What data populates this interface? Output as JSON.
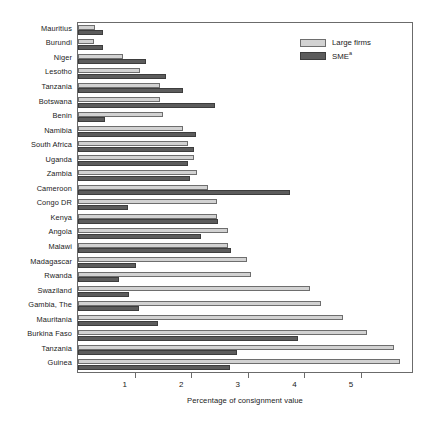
{
  "chart_data": {
    "type": "bar",
    "orientation": "horizontal",
    "title": "",
    "xlabel": "Percentage of consignment value",
    "ylabel": "",
    "xlim": [
      0,
      5.9
    ],
    "xticks": [
      1,
      2,
      3,
      4,
      5
    ],
    "xticklabels": [
      "1",
      "2",
      "3",
      "4",
      "5"
    ],
    "grid": false,
    "legend_position": "top-right",
    "categories": [
      "Mauritius",
      "Burundi",
      "Niger",
      "Lesotho",
      "Tanzania",
      "Botswana",
      "Benin",
      "Namibia",
      "South Africa",
      "Uganda",
      "Zambia",
      "Cameroon",
      "Congo DR",
      "Kenya",
      "Angola",
      "Malawi",
      "Madagascar",
      "Rwanda",
      "Swaziland",
      "Gambia, The",
      "Mauritania",
      "Burkina Faso",
      "Tanzania",
      "Guinea"
    ],
    "series": [
      {
        "name": "Large firms",
        "color": "#d2d2d2",
        "values": [
          0.3,
          0.28,
          0.8,
          1.1,
          1.45,
          1.45,
          1.5,
          1.85,
          1.95,
          2.05,
          2.1,
          2.3,
          2.45,
          2.45,
          2.65,
          2.65,
          2.98,
          3.05,
          4.1,
          4.3,
          4.68,
          5.1,
          5.58,
          5.68
        ]
      },
      {
        "name": "SME",
        "color": "#5c5c5c",
        "values": [
          0.45,
          0.45,
          1.2,
          1.55,
          1.85,
          2.42,
          0.48,
          2.08,
          2.05,
          1.95,
          1.98,
          3.75,
          0.88,
          2.48,
          2.18,
          2.7,
          1.02,
          0.72,
          0.9,
          1.08,
          1.42,
          3.88,
          2.8,
          2.68
        ]
      }
    ]
  },
  "legend": {
    "items": [
      {
        "label": "Large firms",
        "sup": ""
      },
      {
        "label": "SME",
        "sup": "a"
      }
    ]
  },
  "axis": {
    "xtitle": "Percentage of consignment value"
  }
}
